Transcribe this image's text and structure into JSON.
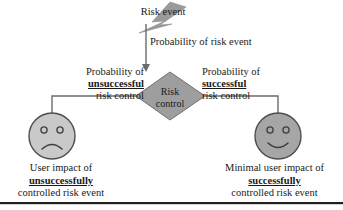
{
  "diagram": {
    "colors": {
      "bolt_fill": "#9a9a9a",
      "diamond_fill": "#9e9e9e",
      "diamond_stroke": "#6f6f6f",
      "sad_face_fill": "#c9c9c9",
      "happy_face_fill": "#a6a6a6",
      "face_stroke": "#4d4d4d",
      "connector": "#6b6b6b",
      "text": "#1a1a1a",
      "rule": "#231f20",
      "background": "#ffffff"
    },
    "nodes": {
      "risk_event": {
        "label": "Risk event",
        "shape": "lightning-bolt"
      },
      "risk_control": {
        "line1": "Risk",
        "line2": "control",
        "shape": "diamond"
      },
      "sad_outcome": {
        "shape": "frowning-face",
        "caption_line1": "User impact of",
        "caption_line2": "unsuccessfully",
        "caption_line3": "controlled risk event"
      },
      "happy_outcome": {
        "shape": "smiling-face",
        "caption_line1": "Minimal user impact of",
        "caption_line2": "successfully",
        "caption_line3": "controlled risk event"
      }
    },
    "edges": {
      "top": {
        "label": "Probability of risk event"
      },
      "left": {
        "line1": "Probability of",
        "line2": "unsuccessful",
        "line3": "risk control"
      },
      "right": {
        "line1": "Probability of",
        "line2": "successful",
        "line3": "risk control"
      }
    }
  }
}
